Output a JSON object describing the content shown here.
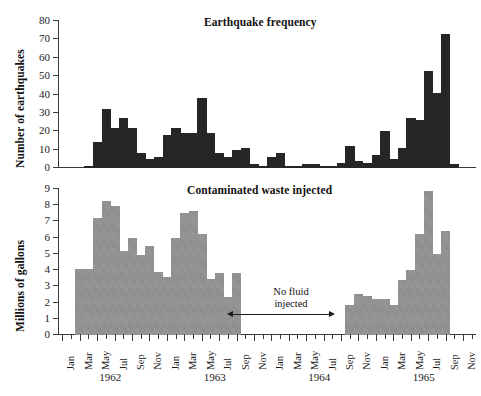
{
  "figure": {
    "width": 481,
    "height": 396,
    "background": "#ffffff"
  },
  "colors": {
    "earthquake_bar": "#262626",
    "waste_bar": "#8c8c8c",
    "axis": "#3a3a3a",
    "text": "#1a1a1a"
  },
  "xaxis": {
    "month_labels": [
      "Jan",
      "Mar",
      "May",
      "Jul",
      "Sep",
      "Nov"
    ],
    "years": [
      "1962",
      "1963",
      "1964",
      "1965"
    ],
    "tick_labels": [
      "Jan",
      "",
      "Mar",
      "",
      "May",
      "",
      "Jul",
      "",
      "Sep",
      "",
      "Nov",
      "",
      "Jan",
      "",
      "Mar",
      "",
      "May",
      "",
      "Jul",
      "",
      "Sep",
      "",
      "Nov",
      "",
      "Jan",
      "",
      "Mar",
      "",
      "May",
      "",
      "Jul",
      "",
      "Sep",
      "",
      "Nov",
      "",
      "Jan",
      "",
      "Mar",
      "",
      "May",
      "",
      "Jul",
      "",
      "Sep",
      "",
      "Nov",
      ""
    ]
  },
  "annotation": {
    "line1": "No fluid",
    "line2": "injected"
  },
  "chart_data": [
    {
      "type": "bar",
      "id": "earthquake-frequency",
      "title": "Earthquake frequency",
      "xlabel": "",
      "ylabel": "Number of earthquakes",
      "ylim": [
        0,
        80
      ],
      "yticks": [
        0,
        10,
        20,
        30,
        40,
        50,
        60,
        70,
        80
      ],
      "grid": false,
      "legend": "none",
      "categories": [
        "Jan 1962",
        "Feb 1962",
        "Mar 1962",
        "Apr 1962",
        "May 1962",
        "Jun 1962",
        "Jul 1962",
        "Aug 1962",
        "Sep 1962",
        "Oct 1962",
        "Nov 1962",
        "Dec 1962",
        "Jan 1963",
        "Feb 1963",
        "Mar 1963",
        "Apr 1963",
        "May 1963",
        "Jun 1963",
        "Jul 1963",
        "Aug 1963",
        "Sep 1963",
        "Oct 1963",
        "Nov 1963",
        "Dec 1963",
        "Jan 1964",
        "Feb 1964",
        "Mar 1964",
        "Apr 1964",
        "May 1964",
        "Jun 1964",
        "Jul 1964",
        "Aug 1964",
        "Sep 1964",
        "Oct 1964",
        "Nov 1964",
        "Dec 1964",
        "Jan 1965",
        "Feb 1965",
        "Mar 1965",
        "Apr 1965",
        "May 1965",
        "Jun 1965",
        "Jul 1965",
        "Aug 1965",
        "Sep 1965",
        "Oct 1965",
        "Nov 1965",
        "Dec 1965"
      ],
      "values": [
        0,
        0,
        0,
        1,
        14,
        32,
        22,
        27,
        22,
        8,
        5,
        6,
        18,
        22,
        19,
        19,
        38,
        19,
        8,
        6,
        10,
        11,
        2,
        1,
        6,
        8,
        1,
        1,
        2,
        2,
        1,
        1,
        3,
        12,
        4,
        3,
        7,
        20,
        5,
        11,
        27,
        26,
        53,
        41,
        73,
        2,
        0,
        0
      ]
    },
    {
      "type": "bar",
      "id": "contaminated-waste-injected",
      "title": "Contaminated waste injected",
      "xlabel": "",
      "ylabel": "Millions of gallons",
      "ylim": [
        0,
        9
      ],
      "yticks": [
        0,
        1,
        2,
        3,
        4,
        5,
        6,
        7,
        8,
        9
      ],
      "grid": false,
      "legend": "none",
      "categories": [
        "Jan 1962",
        "Feb 1962",
        "Mar 1962",
        "Apr 1962",
        "May 1962",
        "Jun 1962",
        "Jul 1962",
        "Aug 1962",
        "Sep 1962",
        "Oct 1962",
        "Nov 1962",
        "Dec 1962",
        "Jan 1963",
        "Feb 1963",
        "Mar 1963",
        "Apr 1963",
        "May 1963",
        "Jun 1963",
        "Jul 1963",
        "Aug 1963",
        "Sep 1963",
        "Oct 1963",
        "Nov 1963",
        "Dec 1963",
        "Jan 1964",
        "Feb 1964",
        "Mar 1964",
        "Apr 1964",
        "May 1964",
        "Jun 1964",
        "Jul 1964",
        "Aug 1964",
        "Sep 1964",
        "Oct 1964",
        "Nov 1964",
        "Dec 1964",
        "Jan 1965",
        "Feb 1965",
        "Mar 1965",
        "Apr 1965",
        "May 1965",
        "Jun 1965",
        "Jul 1965",
        "Aug 1965",
        "Sep 1965",
        "Oct 1965",
        "Nov 1965",
        "Dec 1965"
      ],
      "values": [
        0,
        0,
        4.05,
        4.05,
        7.2,
        8.25,
        7.95,
        5.2,
        5.95,
        4.95,
        5.5,
        3.9,
        3.55,
        5.95,
        7.5,
        7.65,
        6.25,
        3.45,
        3.85,
        2.35,
        3.85,
        0,
        0,
        0,
        0,
        0,
        0,
        0,
        0,
        0,
        0,
        0,
        0,
        1.85,
        2.55,
        2.4,
        2.25,
        2.2,
        1.85,
        3.4,
        4.0,
        6.2,
        8.9,
        5.0,
        6.4,
        0,
        0,
        0
      ]
    }
  ]
}
